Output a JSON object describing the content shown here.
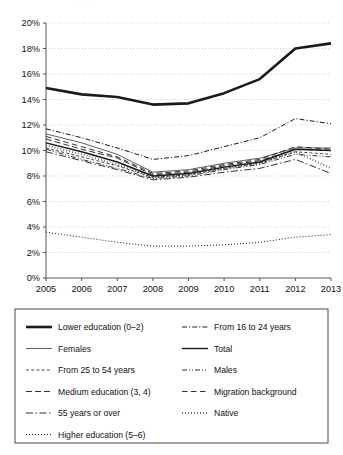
{
  "figure": {
    "background_color": "#ffffff",
    "ink_color": "#1a1a1a",
    "grid_color": "#bfbfbf",
    "axis_color": "#555555",
    "cropped_top_text": "· · · · ·"
  },
  "chart_data": {
    "type": "line",
    "title": "",
    "subtitle": "",
    "xlabel": "",
    "ylabel": "",
    "x": [
      2005,
      2006,
      2007,
      2008,
      2009,
      2010,
      2011,
      2012,
      2013
    ],
    "categories": [
      "2005",
      "2006",
      "2007",
      "2008",
      "2009",
      "2010",
      "2011",
      "2012",
      "2013"
    ],
    "xtick_labels": [
      "2005",
      "2006",
      "2007",
      "2008",
      "2009",
      "2010",
      "2011",
      "2012",
      "2013"
    ],
    "ytick_labels": [
      "0%",
      "2%",
      "4%",
      "6%",
      "8%",
      "10%",
      "12%",
      "14%",
      "16%",
      "18%",
      "20%"
    ],
    "ytick_values": [
      0,
      2,
      4,
      6,
      8,
      10,
      12,
      14,
      16,
      18,
      20
    ],
    "ylim": [
      0,
      20
    ],
    "xlim": [
      2005,
      2013
    ],
    "grid": true,
    "grid_axis": "y",
    "legend_position": "below",
    "legend_columns": 2,
    "value_unit": "%",
    "series": [
      {
        "name": "Lower education (0–2)",
        "style": "solid-bold",
        "stroke_width": 2.6,
        "dash": "none",
        "values": [
          14.9,
          14.4,
          14.2,
          13.6,
          13.7,
          14.5,
          15.6,
          18.0,
          18.4
        ]
      },
      {
        "name": "Females",
        "style": "solid-thin",
        "stroke_width": 0.7,
        "dash": "none",
        "values": [
          11.3,
          10.6,
          9.7,
          8.3,
          8.5,
          9.0,
          9.4,
          10.2,
          10.2
        ]
      },
      {
        "name": "From 25 to 54 years",
        "style": "dashed-fine",
        "stroke_width": 0.8,
        "dash": "3 2.2",
        "values": [
          10.2,
          9.5,
          8.8,
          7.9,
          8.1,
          8.6,
          9.0,
          9.9,
          9.7
        ]
      },
      {
        "name": "Medium education (3, 4)",
        "style": "dashed-long",
        "stroke_width": 0.9,
        "dash": "6 3",
        "values": [
          10.9,
          10.1,
          9.4,
          8.1,
          8.3,
          8.8,
          9.2,
          10.1,
          10.0
        ]
      },
      {
        "name": "55 years or over",
        "style": "dash-dot-long",
        "stroke_width": 0.9,
        "dash": "7 2.5 1.5 2.5",
        "values": [
          9.9,
          9.2,
          8.5,
          7.7,
          7.9,
          8.3,
          8.6,
          9.3,
          8.2
        ]
      },
      {
        "name": "Higher education (5–6)",
        "style": "dotted",
        "stroke_width": 1.0,
        "dash": "1 2",
        "values": [
          3.6,
          3.2,
          2.8,
          2.5,
          2.5,
          2.6,
          2.8,
          3.2,
          3.4
        ]
      },
      {
        "name": "From 16 to 24 years",
        "style": "dash-dot",
        "stroke_width": 1.0,
        "dash": "5 2 1.2 2",
        "values": [
          11.7,
          11.0,
          10.2,
          9.3,
          9.6,
          10.3,
          11.0,
          12.5,
          12.1
        ]
      },
      {
        "name": "Total",
        "style": "solid-medium",
        "stroke_width": 1.4,
        "dash": "none",
        "values": [
          10.6,
          9.9,
          9.1,
          8.0,
          8.2,
          8.7,
          9.1,
          10.1,
          10.0
        ]
      },
      {
        "name": "Males",
        "style": "dash-dot-dot",
        "stroke_width": 0.9,
        "dash": "5 2 1 2 1 2",
        "values": [
          10.1,
          9.3,
          8.6,
          7.8,
          8.0,
          8.5,
          8.9,
          9.7,
          9.5
        ]
      },
      {
        "name": "Migration background",
        "style": "dashed-wide",
        "stroke_width": 0.9,
        "dash": "5.5 3.5",
        "values": [
          11.1,
          10.3,
          9.5,
          8.2,
          8.4,
          8.9,
          9.3,
          10.3,
          10.1
        ]
      },
      {
        "name": "Native",
        "style": "dotted-bold",
        "stroke_width": 1.9,
        "dash": "0.6 2.4",
        "values": [
          10.4,
          9.7,
          8.9,
          7.9,
          8.1,
          8.6,
          9.0,
          9.9,
          8.6
        ]
      }
    ]
  },
  "legend": {
    "columns": [
      {
        "items": [
          {
            "label": "Lower education (0–2)",
            "swatch": "solid-bold"
          },
          {
            "label": "Females",
            "swatch": "solid-thin"
          },
          {
            "label": "From 25 to 54 years",
            "swatch": "dashed-fine"
          },
          {
            "label": "Medium education (3, 4)",
            "swatch": "dashed-long"
          },
          {
            "label": "55 years or over",
            "swatch": "dash-dot-long"
          },
          {
            "label": "Higher education (5–6)",
            "swatch": "dotted"
          }
        ]
      },
      {
        "items": [
          {
            "label": "From 16 to 24 years",
            "swatch": "dash-dot"
          },
          {
            "label": "Total",
            "swatch": "solid-medium"
          },
          {
            "label": "Males",
            "swatch": "dash-dot-dot"
          },
          {
            "label": "Migration background",
            "swatch": "dashed-wide"
          },
          {
            "label": "Native",
            "swatch": "dotted-bold"
          }
        ]
      }
    ]
  }
}
